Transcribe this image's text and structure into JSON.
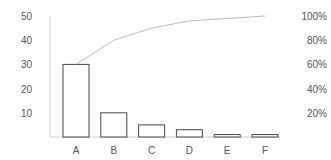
{
  "chart_data": {
    "type": "bar",
    "title": "",
    "xlabel": "",
    "ylabel": "",
    "categories": [
      "A",
      "B",
      "C",
      "D",
      "E",
      "F"
    ],
    "series": [
      {
        "name": "Count",
        "type": "bar",
        "axis": "left",
        "values": [
          30,
          10,
          5,
          3,
          1,
          1
        ]
      },
      {
        "name": "Cumulative %",
        "type": "line",
        "axis": "right",
        "values": [
          60,
          80,
          90,
          96,
          98,
          100
        ]
      }
    ],
    "ylim": [
      0,
      50
    ],
    "y_ticks": [
      "10",
      "20",
      "30",
      "40",
      "50"
    ],
    "y2lim": [
      0,
      100
    ],
    "y2_ticks": [
      "20%",
      "40%",
      "60%",
      "80%",
      "100%"
    ],
    "grid": false,
    "legend": "none"
  },
  "colors": {
    "bar_stroke": "#444444",
    "bar_fill": "#ffffff",
    "line": "#bbbbbb",
    "axis": "#cccccc",
    "text": "#555555"
  }
}
